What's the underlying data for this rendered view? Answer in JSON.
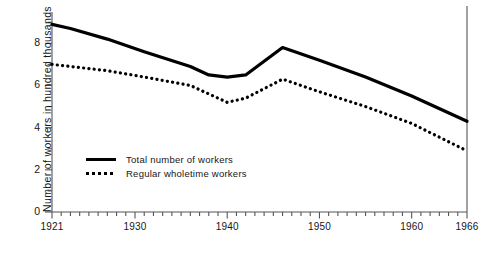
{
  "chart_data": {
    "type": "line",
    "title": "",
    "xlabel": "",
    "ylabel": "Number of workers in hundred thousands",
    "xlim": [
      1921,
      1966
    ],
    "ylim": [
      0,
      9.2
    ],
    "yticks": [
      0,
      2,
      4,
      6,
      8
    ],
    "ytick_labels": [
      "0",
      "2",
      "4",
      "6",
      "8"
    ],
    "xticks": [
      1921,
      1930,
      1940,
      1950,
      1960,
      1966
    ],
    "xtick_labels": [
      "1921",
      "1930",
      "1940",
      "1950",
      "1960",
      "1966"
    ],
    "xtick_minor_step": 1,
    "ytick_minor_step": 1,
    "grid": false,
    "legend_position": "inside-lower-left",
    "series": [
      {
        "name": "Total number of workers",
        "style": "solid",
        "color": "#000000",
        "x": [
          1921,
          1923,
          1927,
          1931,
          1936,
          1938,
          1940,
          1942,
          1946,
          1950,
          1955,
          1960,
          1966
        ],
        "values": [
          8.9,
          8.7,
          8.2,
          7.6,
          6.9,
          6.5,
          6.4,
          6.5,
          7.8,
          7.2,
          6.4,
          5.5,
          4.3
        ]
      },
      {
        "name": "Regular wholetime workers",
        "style": "dotted",
        "color": "#000000",
        "x": [
          1921,
          1923,
          1927,
          1931,
          1936,
          1938,
          1940,
          1942,
          1946,
          1950,
          1955,
          1960,
          1966
        ],
        "values": [
          7.0,
          6.9,
          6.7,
          6.4,
          6.0,
          5.6,
          5.2,
          5.4,
          6.3,
          5.7,
          5.0,
          4.2,
          2.9
        ]
      }
    ]
  },
  "legend": {
    "items": [
      {
        "label": "Total number of workers",
        "style": "solid"
      },
      {
        "label": "Regular wholetime workers",
        "style": "dotted"
      }
    ]
  }
}
